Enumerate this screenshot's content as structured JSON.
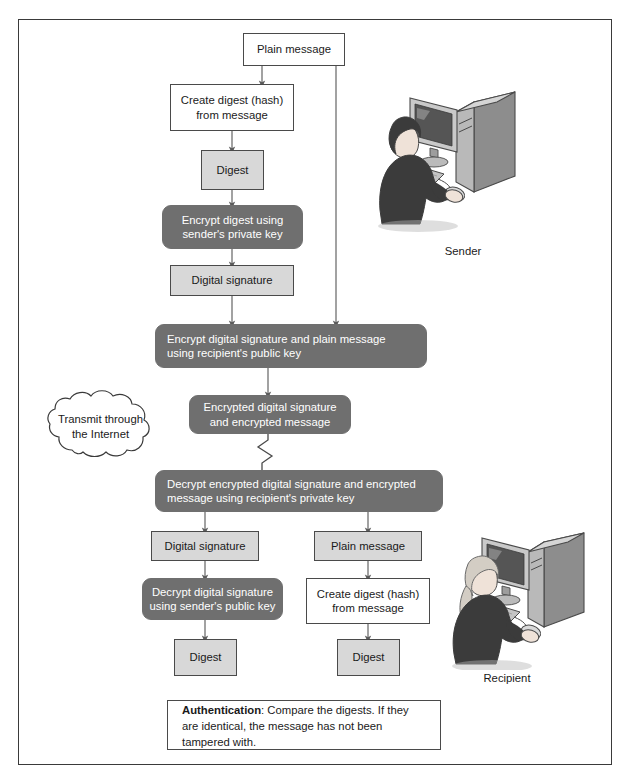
{
  "diagram": {
    "colors": {
      "dark_box": "#6f6f6f",
      "light_box": "#d8d8d8",
      "white_box": "#ffffff",
      "border": "#4a4a4a",
      "frame": "#3a3a3a",
      "text_dark": "#1a1a1a",
      "text_light": "#ffffff"
    },
    "nodes": {
      "plain_message_top": "Plain message",
      "create_digest_top": "Create digest (hash)\nfrom message",
      "digest_top": "Digest",
      "encrypt_digest": "Encrypt digest using\nsender's private key",
      "digital_signature_top": "Digital signature",
      "encrypt_sig_and_msg": "Encrypt digital signature and plain message\nusing recipient's public key",
      "encrypted_sig_msg": "Encrypted digital signature\nand encrypted message",
      "decrypt_encrypted": "Decrypt encrypted digital signature and encrypted\nmessage using recipient's private key",
      "digital_signature_bottom": "Digital signature",
      "plain_message_bottom": "Plain message",
      "decrypt_digital_signature": "Decrypt digital signature\nusing sender's public key",
      "create_digest_bottom": "Create digest (hash)\nfrom message",
      "digest_left_bottom": "Digest",
      "digest_right_bottom": "Digest"
    },
    "cloud": {
      "label": "Transmit through\nthe Internet"
    },
    "note": {
      "bold_label": "Authentication",
      "rest_text": ": Compare the digests. If they are identical, the message has not been tampered with."
    },
    "actors": {
      "sender_caption": "Sender",
      "recipient_caption": "Recipient"
    },
    "icons": {
      "sender": "sender-at-computer-illustration",
      "recipient": "recipient-at-computer-illustration",
      "cloud": "internet-cloud-icon",
      "zigzag": "transmission-zigzag-icon"
    }
  }
}
